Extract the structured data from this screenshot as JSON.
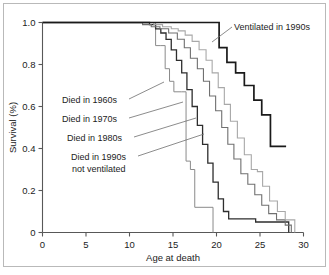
{
  "figure": {
    "background_color": "#ffffff",
    "border_color": "#b9b9b9"
  },
  "chart_data": {
    "type": "line",
    "title": "",
    "subtitle": "",
    "xlabel": "Age at death",
    "ylabel": "Survival (%)",
    "xlim": [
      0,
      30
    ],
    "ylim": [
      0,
      1.0
    ],
    "xticks": [
      0,
      5,
      10,
      15,
      20,
      25,
      30
    ],
    "xtick_labels": [
      "0",
      "5",
      "10",
      "15",
      "20",
      "25",
      "30"
    ],
    "yticks": [
      0,
      0.2,
      0.4,
      0.6,
      0.8,
      1.0
    ],
    "ytick_labels": [
      "0",
      "0.2",
      "0.4",
      "0.6",
      "0.8",
      "1.0"
    ],
    "grid": false,
    "legend_position": "inline-annotations",
    "step_style": "post",
    "series": [
      {
        "name": "Died in 1960s",
        "color": "#8a8a8a",
        "stroke_width": 1.0,
        "x": [
          0,
          5.7,
          13.0,
          13.6,
          14.1,
          14.6,
          15.1,
          16.0,
          16.5,
          17.0,
          17.5,
          19.6,
          19.6
        ],
        "y": [
          1.0,
          1.0,
          0.89,
          0.89,
          0.78,
          0.72,
          0.67,
          0.67,
          0.34,
          0.3,
          0.12,
          0.12,
          0.0
        ]
      },
      {
        "name": "Died in 1970s",
        "color": "#2e2e2e",
        "stroke_width": 1.3,
        "x": [
          0,
          11.5,
          12.3,
          13.0,
          13.6,
          14.2,
          14.8,
          15.4,
          16.0,
          16.6,
          17.2,
          17.8,
          18.4,
          19.0,
          19.6,
          20.2,
          20.8,
          21.4,
          24.5,
          28.3,
          28.3
        ],
        "y": [
          1.0,
          1.0,
          0.99,
          0.97,
          0.95,
          0.92,
          0.87,
          0.82,
          0.76,
          0.68,
          0.6,
          0.51,
          0.42,
          0.33,
          0.24,
          0.16,
          0.1,
          0.065,
          0.05,
          0.05,
          0.0
        ]
      },
      {
        "name": "Died in 1980s",
        "color": "#707070",
        "stroke_width": 1.1,
        "x": [
          0,
          10.0,
          11.5,
          12.5,
          13.5,
          14.5,
          15.5,
          16.3,
          17.0,
          17.8,
          18.5,
          19.2,
          19.9,
          20.6,
          21.3,
          22.0,
          22.8,
          23.6,
          24.4,
          25.2,
          26.0,
          26.9,
          27.9,
          28.6,
          28.6
        ],
        "y": [
          1.0,
          1.0,
          0.99,
          0.98,
          0.97,
          0.95,
          0.92,
          0.88,
          0.83,
          0.78,
          0.72,
          0.65,
          0.58,
          0.5,
          0.42,
          0.35,
          0.28,
          0.23,
          0.18,
          0.13,
          0.09,
          0.06,
          0.035,
          0.015,
          0.0
        ]
      },
      {
        "name": "Died in 1990s not ventilated",
        "color": "#a8a8a8",
        "stroke_width": 1.1,
        "x": [
          0,
          11.8,
          12.8,
          13.8,
          14.8,
          15.6,
          16.4,
          17.2,
          18.0,
          18.8,
          19.5,
          20.2,
          20.9,
          21.6,
          22.4,
          23.2,
          24.0,
          24.7,
          25.3,
          25.3,
          26.1,
          27.0,
          27.9,
          29.0,
          29.0
        ],
        "y": [
          1.0,
          1.0,
          0.99,
          0.98,
          0.97,
          0.96,
          0.94,
          0.91,
          0.87,
          0.82,
          0.76,
          0.69,
          0.61,
          0.53,
          0.45,
          0.37,
          0.3,
          0.29,
          0.22,
          0.22,
          0.15,
          0.1,
          0.06,
          0.02,
          0.0
        ]
      },
      {
        "name": "Ventilated in 1990s",
        "color": "#1a1a1a",
        "stroke_width": 1.7,
        "x": [
          0,
          19.5,
          20.3,
          21.2,
          22.2,
          23.2,
          24.3,
          25.2,
          26.2,
          28.0
        ],
        "y": [
          1.0,
          1.0,
          0.88,
          0.81,
          0.76,
          0.7,
          0.63,
          0.56,
          0.41,
          0.41
        ]
      }
    ],
    "annotations": [
      {
        "text": "Ventilated in 1990s",
        "text_x": 234,
        "text_y": 30,
        "leader_from_x": 232,
        "leader_from_y": 27,
        "leader_to_x": 212,
        "leader_to_y": 42
      },
      {
        "text": "Died in 1960s",
        "text_x": 62,
        "text_y": 103,
        "leader_from_x": 129,
        "leader_from_y": 99,
        "leader_to_x": 164,
        "leader_to_y": 82
      },
      {
        "text": "Died in 1970s",
        "text_x": 62,
        "text_y": 122,
        "leader_from_x": 129,
        "leader_from_y": 118,
        "leader_to_x": 183,
        "leader_to_y": 102
      },
      {
        "text": "Died in 1980s",
        "text_x": 67,
        "text_y": 141,
        "leader_from_x": 134,
        "leader_from_y": 137,
        "leader_to_x": 196,
        "leader_to_y": 118
      },
      {
        "text": "Died in 1990s",
        "text_x": 71,
        "text_y": 160,
        "leader_from_x": 138,
        "leader_from_y": 156,
        "leader_to_x": 204,
        "leader_to_y": 134
      },
      {
        "text": "not ventilated",
        "text_x": 72,
        "text_y": 172,
        "leader_from_x": null,
        "leader_from_y": null,
        "leader_to_x": null,
        "leader_to_y": null
      }
    ]
  }
}
